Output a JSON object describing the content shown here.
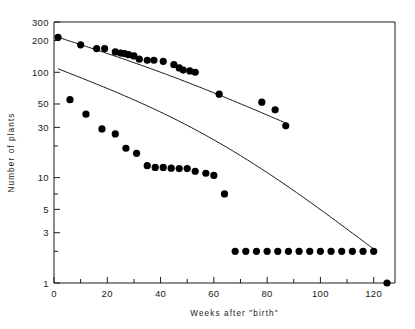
{
  "chart_data": {
    "type": "scatter",
    "title": "",
    "xlabel": "Weeks after \"birth\"",
    "ylabel": "Number of plants",
    "yscale": "log",
    "xscale": "linear",
    "xlim": [
      0,
      128
    ],
    "ylim": [
      1,
      300
    ],
    "xticks": [
      0,
      20,
      40,
      60,
      80,
      100,
      120
    ],
    "xtick_labels": [
      "0",
      "20",
      "40",
      "60",
      "80",
      "100",
      "120"
    ],
    "xminor_ticks": [
      10,
      30,
      50,
      70,
      90,
      110
    ],
    "yticks": [
      300,
      200,
      100,
      50,
      30,
      10,
      5,
      3,
      1
    ],
    "ytick_labels": [
      "300",
      "200",
      "100",
      "50",
      "30",
      "10",
      "5",
      "3",
      "1"
    ],
    "yminor_ticks": [
      20,
      7,
      2
    ],
    "grid": false,
    "legend": "none",
    "series": [
      {
        "name": "upper-cohort",
        "marker": "filled-circle",
        "fitted_line": {
          "x": [
            1.5,
            87
          ],
          "y": [
            215,
            33
          ]
        },
        "points": [
          {
            "x": 1.5,
            "y": 215
          },
          {
            "x": 10,
            "y": 182
          },
          {
            "x": 16,
            "y": 168
          },
          {
            "x": 19,
            "y": 168
          },
          {
            "x": 23,
            "y": 156
          },
          {
            "x": 25,
            "y": 152
          },
          {
            "x": 26.5,
            "y": 150
          },
          {
            "x": 28,
            "y": 147
          },
          {
            "x": 30,
            "y": 143
          },
          {
            "x": 32,
            "y": 133
          },
          {
            "x": 35,
            "y": 130
          },
          {
            "x": 37.5,
            "y": 130
          },
          {
            "x": 41,
            "y": 127
          },
          {
            "x": 45,
            "y": 118
          },
          {
            "x": 47,
            "y": 110
          },
          {
            "x": 48.5,
            "y": 105
          },
          {
            "x": 51,
            "y": 103
          },
          {
            "x": 53,
            "y": 100
          },
          {
            "x": 62,
            "y": 62
          },
          {
            "x": 78,
            "y": 52
          },
          {
            "x": 83,
            "y": 44
          },
          {
            "x": 87,
            "y": 31
          }
        ]
      },
      {
        "name": "lower-cohort",
        "marker": "filled-circle",
        "fitted_line": {
          "x": [
            1.5,
            120
          ],
          "y": [
            108,
            2.1
          ]
        },
        "points": [
          {
            "x": 6,
            "y": 55
          },
          {
            "x": 12,
            "y": 40
          },
          {
            "x": 18,
            "y": 29
          },
          {
            "x": 23,
            "y": 26
          },
          {
            "x": 27,
            "y": 19
          },
          {
            "x": 31,
            "y": 17
          },
          {
            "x": 35,
            "y": 13
          },
          {
            "x": 38,
            "y": 12.5
          },
          {
            "x": 41,
            "y": 12.5
          },
          {
            "x": 44,
            "y": 12.3
          },
          {
            "x": 47,
            "y": 12.2
          },
          {
            "x": 50,
            "y": 12.2
          },
          {
            "x": 53,
            "y": 11.5
          },
          {
            "x": 57,
            "y": 11
          },
          {
            "x": 60,
            "y": 10.5
          },
          {
            "x": 64,
            "y": 7
          },
          {
            "x": 68,
            "y": 2
          },
          {
            "x": 72,
            "y": 2
          },
          {
            "x": 76,
            "y": 2
          },
          {
            "x": 80,
            "y": 2
          },
          {
            "x": 84,
            "y": 2
          },
          {
            "x": 88,
            "y": 2
          },
          {
            "x": 92,
            "y": 2
          },
          {
            "x": 96,
            "y": 2
          },
          {
            "x": 100,
            "y": 2
          },
          {
            "x": 104,
            "y": 2
          },
          {
            "x": 108,
            "y": 2
          },
          {
            "x": 112,
            "y": 2
          },
          {
            "x": 116,
            "y": 2
          },
          {
            "x": 120,
            "y": 2
          },
          {
            "x": 125,
            "y": 1
          }
        ]
      }
    ]
  }
}
